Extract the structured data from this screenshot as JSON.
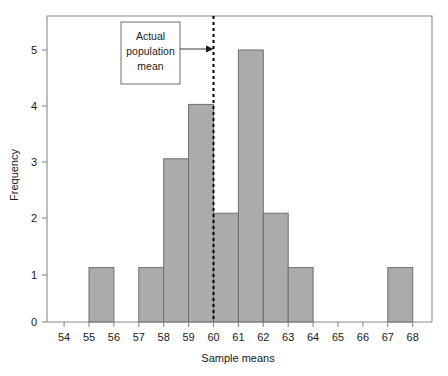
{
  "chart_data": {
    "type": "bar",
    "title": "",
    "subtitle": "",
    "xlabel": "Sample means",
    "ylabel": "Frequency",
    "xlim": [
      53.5,
      68.8
    ],
    "ylim": [
      0,
      5.5
    ],
    "grid": false,
    "legend": "none",
    "bin_width": 1,
    "bin_starts": [
      54,
      55,
      56,
      57,
      58,
      59,
      60,
      61,
      62,
      63,
      64,
      65,
      66,
      67
    ],
    "bin_labels": [
      "54-55",
      "55-56",
      "56-57",
      "57-58",
      "58-59",
      "59-60",
      "60-61",
      "61-62",
      "62-63",
      "63-64",
      "64-65",
      "65-66",
      "66-67",
      "67-68"
    ],
    "values": [
      0,
      1,
      0,
      1,
      3,
      4,
      2,
      5,
      2,
      1,
      0,
      0,
      0,
      1
    ],
    "xticks": [
      54,
      55,
      56,
      57,
      58,
      59,
      60,
      61,
      62,
      63,
      64,
      65,
      66,
      67,
      68
    ],
    "xtick_labels": [
      "54",
      "55",
      "56",
      "57",
      "58",
      "59",
      "60",
      "61",
      "62",
      "63",
      "64",
      "65",
      "66",
      "67",
      "68"
    ],
    "yticks": [
      0,
      1,
      2,
      3,
      4,
      5
    ],
    "ytick_labels": [
      "0",
      "1",
      "2",
      "3",
      "4",
      "5"
    ],
    "bar_color": "#ababab",
    "bar_edge_color": "#6f6f6f",
    "annotations": [
      {
        "name": "actual-population-mean",
        "lines": [
          "Actual",
          "population",
          "mean"
        ],
        "points_to_x": 60,
        "line_style": "dashed",
        "line_color": "#000000"
      }
    ]
  }
}
